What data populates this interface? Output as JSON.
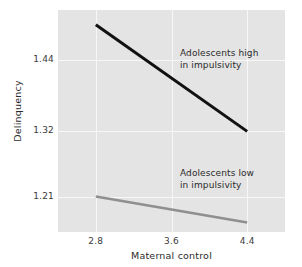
{
  "chart_data": {
    "type": "line",
    "title": "",
    "xlabel": "Maternal control",
    "ylabel": "Delinquency",
    "xlim": [
      2.4,
      4.8
    ],
    "ylim": [
      1.15,
      1.525
    ],
    "xticks": [
      "2.8",
      "3.6",
      "4.4"
    ],
    "xtick_values": [
      2.8,
      3.6,
      4.4
    ],
    "yticks": [
      "1.44",
      "1.32",
      "1.21"
    ],
    "ytick_values": [
      1.44,
      1.32,
      1.21
    ],
    "grid": "both",
    "legend": "annotations-inline",
    "panel_color": "#e4e4e4",
    "grid_color": "#f7f7f7",
    "series": [
      {
        "name": "Adolescents high in impulsivity",
        "color": "#111111",
        "width": 3,
        "x": [
          2.8,
          4.4
        ],
        "values": [
          1.5,
          1.32
        ]
      },
      {
        "name": "Adolescents low in impulsivity",
        "color": "#8f8f8f",
        "width": 2.5,
        "x": [
          2.8,
          4.4
        ],
        "values": [
          1.21,
          1.166
        ]
      }
    ],
    "annotations": [
      {
        "id": "high",
        "line1": "Adolescents high",
        "line2": "in impulsivity"
      },
      {
        "id": "low",
        "line1": "Adolescents low",
        "line2": "in impulsivity"
      }
    ]
  }
}
